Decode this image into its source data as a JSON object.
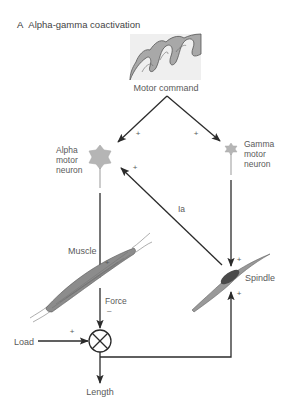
{
  "title": {
    "panel_letter": "A",
    "text": "Alpha-gamma coactivation"
  },
  "labels": {
    "motor_command": "Motor command",
    "alpha_line1": "Alpha",
    "alpha_line2": "motor",
    "alpha_line3": "neuron",
    "gamma_line1": "Gamma",
    "gamma_line2": "motor",
    "gamma_line3": "neuron",
    "ia": "Ia",
    "muscle": "Muscle",
    "spindle": "Spindle",
    "force": "Force",
    "force_sign": "–",
    "load": "Load",
    "length": "Length"
  },
  "signs": {
    "cmd_to_alpha": "+",
    "cmd_to_gamma": "+",
    "ia_to_alpha": "+",
    "alpha_to_muscle": "+",
    "gamma_to_spindle": "+",
    "length_to_spindle": "+",
    "load": "+"
  },
  "colors": {
    "line": "#2b2b2b",
    "neuron_fill": "#b5b5b5",
    "brain_fill": "#a8a8a8",
    "brain_stroke": "#555555",
    "muscle_fill": "#8c8c8c",
    "spindle_dark": "#4a4a4a"
  }
}
